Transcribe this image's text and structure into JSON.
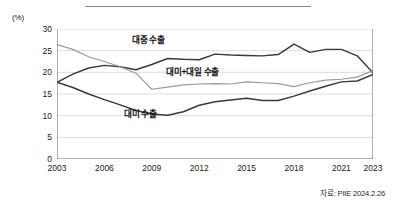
{
  "axis": {
    "y_unit": "(%)",
    "y_ticks": [
      0,
      5,
      10,
      15,
      20,
      25,
      30
    ],
    "x_ticks": [
      "2003",
      "2006",
      "2009",
      "2012",
      "2015",
      "2018",
      "2021",
      "2023"
    ]
  },
  "labels": {
    "china": "대중 수출",
    "us_japan": "대미+대일 수출",
    "us": "대미 수출"
  },
  "source": "자료: PIIE 2024.2.26",
  "colors": {
    "china_line": "#3a3a3a",
    "us_line": "#3a3a3a",
    "us_japan_line": "#9a9a9a",
    "grid": "#cfcfcf",
    "axis": "#555555"
  },
  "chart_data": {
    "type": "line",
    "title": "",
    "xlabel": "",
    "ylabel": "(%)",
    "ylim": [
      0,
      30
    ],
    "xlim": [
      2003,
      2023
    ],
    "grid": true,
    "legend_position": "inline-annotations",
    "x": [
      2003,
      2004,
      2005,
      2006,
      2007,
      2008,
      2009,
      2010,
      2011,
      2012,
      2013,
      2014,
      2015,
      2016,
      2017,
      2018,
      2019,
      2020,
      2021,
      2022,
      2023
    ],
    "series": [
      {
        "name": "대중 수출",
        "color": "#3a3a3a",
        "values": [
          17.7,
          19.6,
          21.0,
          21.6,
          21.3,
          20.6,
          21.8,
          23.2,
          23.0,
          22.9,
          24.2,
          24.0,
          23.9,
          23.8,
          24.1,
          26.5,
          24.6,
          25.3,
          25.3,
          23.8,
          19.9
        ]
      },
      {
        "name": "대미+대일 수출",
        "color": "#9a9a9a",
        "values": [
          26.4,
          25.3,
          23.6,
          22.5,
          21.3,
          19.8,
          16.1,
          16.6,
          17.1,
          17.3,
          17.4,
          17.3,
          17.8,
          17.6,
          17.4,
          16.7,
          17.6,
          18.2,
          18.4,
          18.9,
          20.4
        ]
      },
      {
        "name": "대미 수출",
        "color": "#3a3a3a",
        "values": [
          17.7,
          16.5,
          15.0,
          13.7,
          12.5,
          11.2,
          10.4,
          10.1,
          10.9,
          12.4,
          13.2,
          13.6,
          14.0,
          13.5,
          13.5,
          14.5,
          15.7,
          16.8,
          17.8,
          18.0,
          19.5
        ]
      }
    ]
  }
}
